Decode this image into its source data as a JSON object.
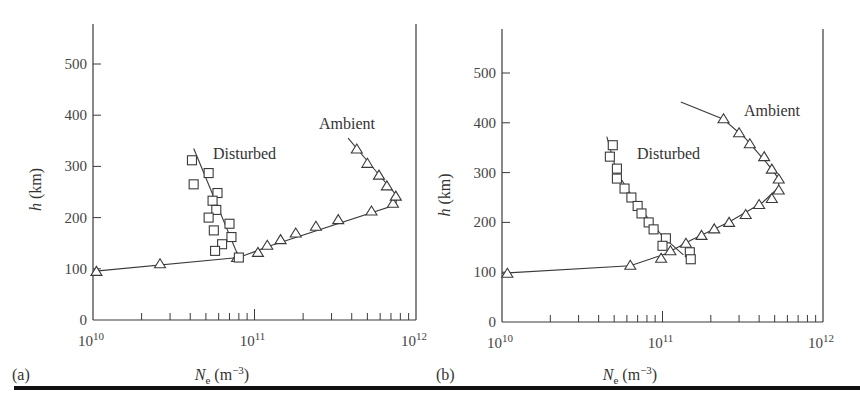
{
  "figure": {
    "panel_labels": [
      "(a)",
      "(b)"
    ],
    "curve_labels": {
      "disturbed": "Disturbed",
      "ambient": "Ambient"
    },
    "xlabel_main": "N",
    "xlabel_sub": "e",
    "xlabel_unit": " (m",
    "xlabel_exp": "−3",
    "xlabel_close": ")",
    "ylabel_var": "h",
    "ylabel_unit": " (km)",
    "y_ticks": [
      "0",
      "100",
      "200",
      "300",
      "400",
      "500"
    ],
    "x_ticks": [
      {
        "base": "10",
        "exp": "10"
      },
      {
        "base": "10",
        "exp": "11"
      },
      {
        "base": "10",
        "exp": "12"
      }
    ],
    "colors": {
      "ink": "#3a3a3a",
      "rule": "#111111",
      "background": "#ffffff"
    }
  },
  "chart_data": [
    {
      "type": "scatter",
      "panel": "(a)",
      "title": "",
      "xlabel": "Ne (m^-3)",
      "ylabel": "h (km)",
      "xscale": "log",
      "xlim": [
        10000000000.0,
        1000000000000.0
      ],
      "ylim": [
        0,
        580
      ],
      "y_ticks": [
        0,
        100,
        200,
        300,
        400,
        500
      ],
      "x_ticks": [
        10000000000.0,
        100000000000.0,
        1000000000000.0
      ],
      "grid": false,
      "series": [
        {
          "name": "Ambient",
          "marker": "triangle",
          "points": [
            [
              10500000000.0,
              95
            ],
            [
              26000000000.0,
              110
            ],
            [
              78000000000.0,
              122
            ],
            [
              105000000000.0,
              132
            ],
            [
              120000000000.0,
              146
            ],
            [
              145000000000.0,
              157
            ],
            [
              180000000000.0,
              170
            ],
            [
              240000000000.0,
              183
            ],
            [
              330000000000.0,
              196
            ],
            [
              530000000000.0,
              213
            ],
            [
              720000000000.0,
              228
            ],
            [
              750000000000.0,
              242
            ],
            [
              660000000000.0,
              262
            ],
            [
              590000000000.0,
              283
            ],
            [
              500000000000.0,
              306
            ],
            [
              430000000000.0,
              334
            ]
          ],
          "fit_line": [
            [
              10000000000.0,
              95
            ],
            [
              80000000000.0,
              122
            ],
            [
              120000000000.0,
              143
            ],
            [
              750000000000.0,
              225
            ],
            [
              760000000000.0,
              243
            ],
            [
              550000000000.0,
              295
            ],
            [
              380000000000.0,
              355
            ]
          ]
        },
        {
          "name": "Disturbed",
          "marker": "square",
          "points": [
            [
              41000000000.0,
              312
            ],
            [
              42000000000.0,
              265
            ],
            [
              52000000000.0,
              287
            ],
            [
              59000000000.0,
              248
            ],
            [
              55000000000.0,
              233
            ],
            [
              58000000000.0,
              215
            ],
            [
              52000000000.0,
              200
            ],
            [
              70000000000.0,
              188
            ],
            [
              56000000000.0,
              175
            ],
            [
              72000000000.0,
              162
            ],
            [
              63000000000.0,
              148
            ],
            [
              57000000000.0,
              135
            ],
            [
              80000000000.0,
              122
            ]
          ],
          "fit_line": [
            [
              42000000000.0,
              335
            ],
            [
              80000000000.0,
              122
            ]
          ]
        }
      ]
    },
    {
      "type": "scatter",
      "panel": "(b)",
      "title": "",
      "xlabel": "Ne (m^-3)",
      "ylabel": "h (km)",
      "xscale": "log",
      "xlim": [
        10000000000.0,
        1000000000000.0
      ],
      "ylim": [
        0,
        580
      ],
      "y_ticks": [
        0,
        100,
        200,
        300,
        400,
        500
      ],
      "x_ticks": [
        10000000000.0,
        100000000000.0,
        1000000000000.0
      ],
      "grid": false,
      "series": [
        {
          "name": "Ambient",
          "marker": "triangle",
          "points": [
            [
              10800000000.0,
              98
            ],
            [
              63000000000.0,
              114
            ],
            [
              98000000000.0,
              128
            ],
            [
              112000000000.0,
              143
            ],
            [
              140000000000.0,
              158
            ],
            [
              175000000000.0,
              174
            ],
            [
              210000000000.0,
              187
            ],
            [
              260000000000.0,
              200
            ],
            [
              330000000000.0,
              216
            ],
            [
              400000000000.0,
              236
            ],
            [
              480000000000.0,
              248
            ],
            [
              530000000000.0,
              265
            ],
            [
              530000000000.0,
              287
            ],
            [
              480000000000.0,
              307
            ],
            [
              430000000000.0,
              332
            ],
            [
              350000000000.0,
              358
            ],
            [
              300000000000.0,
              380
            ],
            [
              240000000000.0,
              408
            ]
          ],
          "fit_line": [
            [
              10000000000.0,
              98
            ],
            [
              63000000000.0,
              113
            ],
            [
              105000000000.0,
              137
            ],
            [
              150000000000.0,
              164
            ],
            [
              260000000000.0,
              201
            ],
            [
              420000000000.0,
              240
            ],
            [
              530000000000.0,
              270
            ],
            [
              530000000000.0,
              288
            ],
            [
              450000000000.0,
              318
            ],
            [
              330000000000.0,
              368
            ],
            [
              240000000000.0,
              407
            ],
            [
              130000000000.0,
              442
            ]
          ]
        },
        {
          "name": "Disturbed",
          "marker": "square",
          "points": [
            [
              49000000000.0,
              355
            ],
            [
              47000000000.0,
              332
            ],
            [
              52000000000.0,
              308
            ],
            [
              52000000000.0,
              288
            ],
            [
              58000000000.0,
              268
            ],
            [
              64000000000.0,
              250
            ],
            [
              70000000000.0,
              233
            ],
            [
              74000000000.0,
              218
            ],
            [
              82000000000.0,
              200
            ],
            [
              88000000000.0,
              186
            ],
            [
              105000000000.0,
              168
            ],
            [
              100000000000.0,
              153
            ],
            [
              148000000000.0,
              140
            ],
            [
              150000000000.0,
              126
            ]
          ],
          "fit_line": [
            [
              45000000000.0,
              372
            ],
            [
              52000000000.0,
              300
            ],
            [
              70000000000.0,
              235
            ],
            [
              100000000000.0,
              172
            ],
            [
              135000000000.0,
              135
            ]
          ]
        }
      ]
    }
  ]
}
